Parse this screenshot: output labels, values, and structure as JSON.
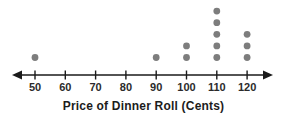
{
  "chart_data": {
    "type": "dot_plot",
    "title": "Price of Dinner Roll (Cents)",
    "axis": {
      "min": 50,
      "max": 120,
      "step": 10,
      "tick_labels": [
        "50",
        "60",
        "70",
        "80",
        "90",
        "100",
        "110",
        "120"
      ],
      "double_arrow": true
    },
    "points": [
      {
        "value": 50,
        "count": 1
      },
      {
        "value": 90,
        "count": 1
      },
      {
        "value": 100,
        "count": 2
      },
      {
        "value": 110,
        "count": 5
      },
      {
        "value": 120,
        "count": 3
      }
    ],
    "colors": {
      "dot": "#7d7d7d",
      "axis": "#1a1a1a",
      "tick_label": "#2b2b2b",
      "title": "#1c1c1c"
    }
  }
}
